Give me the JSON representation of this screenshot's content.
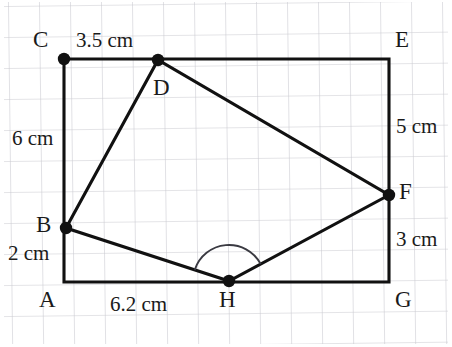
{
  "figure": {
    "background_color": "#ffffff",
    "grid_color": "#c9c9cf",
    "stroke_color": "#111111",
    "grid_spacing_px": 31,
    "canvas": {
      "width": 452,
      "height": 347
    }
  },
  "vertices": [
    {
      "id": "A",
      "label": "A",
      "x": 64,
      "y": 282,
      "dot": false,
      "label_x": 39,
      "label_y": 288
    },
    {
      "id": "B",
      "label": "B",
      "x": 66,
      "y": 228,
      "dot": true,
      "label_x": 36,
      "label_y": 213
    },
    {
      "id": "C",
      "label": "C",
      "x": 64,
      "y": 59,
      "dot": true,
      "label_x": 33,
      "label_y": 28
    },
    {
      "id": "D",
      "label": "D",
      "x": 158,
      "y": 60,
      "dot": true,
      "label_x": 153,
      "label_y": 76
    },
    {
      "id": "E",
      "label": "E",
      "x": 389,
      "y": 59,
      "dot": false,
      "label_x": 395,
      "label_y": 28
    },
    {
      "id": "F",
      "label": "F",
      "x": 389,
      "y": 195,
      "dot": true,
      "label_x": 399,
      "label_y": 180
    },
    {
      "id": "G",
      "label": "G",
      "x": 389,
      "y": 282,
      "dot": false,
      "label_x": 395,
      "label_y": 288
    },
    {
      "id": "H",
      "label": "H",
      "x": 229,
      "y": 281,
      "dot": true,
      "label_x": 219,
      "label_y": 288
    }
  ],
  "rectangle": {
    "name": "bounding-rectangle-ACEG",
    "path": "A,C,E,G",
    "points": [
      [
        64,
        282
      ],
      [
        64,
        59
      ],
      [
        389,
        59
      ],
      [
        389,
        282
      ]
    ]
  },
  "quadrilateral": {
    "name": "quadrilateral-BDFH",
    "path": "B,D,F,H",
    "points": [
      [
        66,
        228
      ],
      [
        158,
        60
      ],
      [
        389,
        195
      ],
      [
        229,
        281
      ]
    ]
  },
  "angle_arc": {
    "at_vertex": "H",
    "center": [
      229,
      281
    ],
    "radius": 36,
    "between": [
      "B",
      "F"
    ]
  },
  "measurements": [
    {
      "id": "cd",
      "text": "3.5 cm",
      "edge": "C-D",
      "x": 76,
      "y": 30
    },
    {
      "id": "bc",
      "text": "6 cm",
      "edge": "B-C",
      "x": 12,
      "y": 128
    },
    {
      "id": "ab",
      "text": "2 cm",
      "edge": "A-B",
      "x": 8,
      "y": 243
    },
    {
      "id": "ah",
      "text": "6.2 cm",
      "edge": "A-H",
      "x": 110,
      "y": 294
    },
    {
      "id": "ef",
      "text": "5 cm",
      "edge": "E-F",
      "x": 396,
      "y": 116
    },
    {
      "id": "fg",
      "text": "3 cm",
      "edge": "F-G",
      "x": 396,
      "y": 229
    }
  ]
}
